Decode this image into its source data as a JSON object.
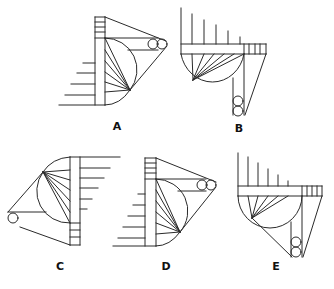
{
  "figure": {
    "line_color": "#2a2a2a",
    "background": "#ffffff"
  },
  "options": [
    {
      "label": "A",
      "x": 111,
      "y": 126
    },
    {
      "label": "B",
      "x": 239,
      "y": 128
    },
    {
      "label": "C",
      "x": 50,
      "y": 266
    },
    {
      "label": "D",
      "x": 166,
      "y": 266
    },
    {
      "label": "E",
      "x": 275,
      "y": 266
    }
  ]
}
